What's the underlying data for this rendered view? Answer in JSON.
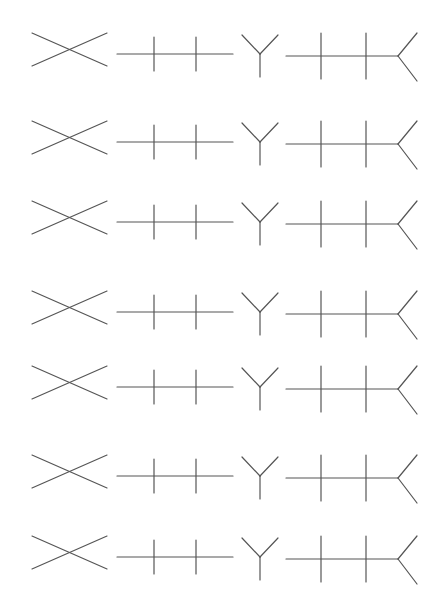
{
  "page": {
    "width": 444,
    "height": 611,
    "background": "#ffffff",
    "stroke_color": "#555555"
  },
  "figure_types": [
    "x-cross",
    "line-two-ticks",
    "y-fork",
    "line-two-ticks-forked-end"
  ],
  "rows": [
    {
      "index": 1,
      "cy": 49
    },
    {
      "index": 2,
      "cy": 137
    },
    {
      "index": 3,
      "cy": 217
    },
    {
      "index": 4,
      "cy": 307
    },
    {
      "index": 5,
      "cy": 382
    },
    {
      "index": 6,
      "cy": 471
    },
    {
      "index": 7,
      "cy": 552
    }
  ]
}
